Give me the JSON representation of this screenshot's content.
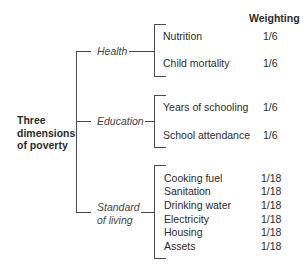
{
  "header": {
    "weighting_label": "Weighting"
  },
  "root": {
    "line1": "Three",
    "line2": "dimensions",
    "line3": "of poverty"
  },
  "dimensions": [
    {
      "name": "Health",
      "indicators": [
        {
          "label": "Nutrition",
          "weight": "1/6"
        },
        {
          "label": "Child mortality",
          "weight": "1/6"
        }
      ]
    },
    {
      "name": "Education",
      "indicators": [
        {
          "label": "Years of schooling",
          "weight": "1/6"
        },
        {
          "label": "School attendance",
          "weight": "1/6"
        }
      ]
    },
    {
      "name_line1": "Standard",
      "name_line2": "of living",
      "indicators": [
        {
          "label": "Cooking fuel",
          "weight": "1/18"
        },
        {
          "label": "Sanitation",
          "weight": "1/18"
        },
        {
          "label": "Drinking water",
          "weight": "1/18"
        },
        {
          "label": "Electricity",
          "weight": "1/18"
        },
        {
          "label": "Housing",
          "weight": "1/18"
        },
        {
          "label": "Assets",
          "weight": "1/18"
        }
      ]
    }
  ]
}
